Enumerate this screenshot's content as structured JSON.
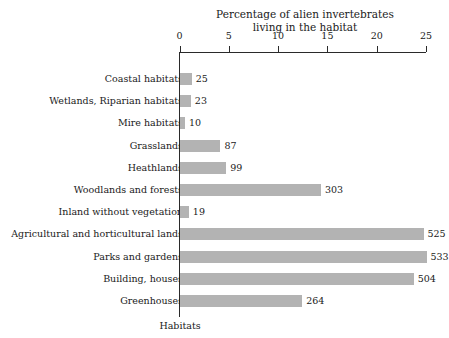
{
  "chart_data": {
    "type": "bar",
    "orientation": "horizontal",
    "title": "Percentage of alien invertebrates living in the habitat",
    "title_lines": [
      "Percentage of alien invertebrates",
      "living in the habitat"
    ],
    "xlabel": "",
    "ylabel": "Habitats",
    "xlim": [
      0,
      25
    ],
    "xticks": [
      0,
      5,
      10,
      15,
      20,
      25
    ],
    "xtick_labels": [
      "0",
      "5",
      "10",
      "15",
      "20",
      "25"
    ],
    "grid": false,
    "legend": false,
    "bar_color": "#b3b3b3",
    "axis_color": "#2a2a2a",
    "categories": [
      "Coastal habitats",
      "Wetlands, Riparian habitats",
      "Mire habitats",
      "Grasslands",
      "Heathlands",
      "Woodlands and forests",
      "Inland without vegetation",
      "Agricultural and horticultural lands",
      "Parks and gardens",
      "Building, houses",
      "Greenhouses"
    ],
    "values": [
      1.2,
      1.1,
      0.5,
      4.1,
      4.7,
      14.3,
      0.9,
      24.7,
      25.0,
      23.7,
      12.4
    ],
    "data_labels": [
      "25",
      "23",
      "10",
      "87",
      "99",
      "303",
      "19",
      "525",
      "533",
      "504",
      "264"
    ],
    "bars": [
      {
        "category": "Coastal habitats",
        "value": 1.2,
        "label": "25"
      },
      {
        "category": "Wetlands, Riparian habitats",
        "value": 1.1,
        "label": "23"
      },
      {
        "category": "Mire habitats",
        "value": 0.5,
        "label": "10"
      },
      {
        "category": "Grasslands",
        "value": 4.1,
        "label": "87"
      },
      {
        "category": "Heathlands",
        "value": 4.7,
        "label": "99"
      },
      {
        "category": "Woodlands and forests",
        "value": 14.3,
        "label": "303"
      },
      {
        "category": "Inland without vegetation",
        "value": 0.9,
        "label": "19"
      },
      {
        "category": "Agricultural and horticultural lands",
        "value": 24.7,
        "label": "525"
      },
      {
        "category": "Parks and gardens",
        "value": 25.0,
        "label": "533"
      },
      {
        "category": "Building, houses",
        "value": 23.7,
        "label": "504"
      },
      {
        "category": "Greenhouses",
        "value": 12.4,
        "label": "264"
      }
    ]
  }
}
